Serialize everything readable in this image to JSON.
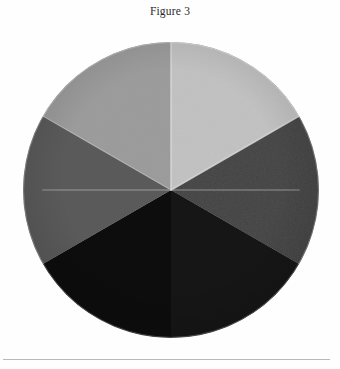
{
  "figure": {
    "caption": "Figure 3"
  },
  "chart_data": {
    "type": "pie",
    "title": "Figure 3",
    "subtitle": "",
    "xlabel": "",
    "ylabel": "",
    "legend": "none",
    "grid": false,
    "note": "Six-sector grayscale value wheel; each sector spans 60 degrees of the circle.",
    "center_x": 171,
    "center_y": 190,
    "radius": 148,
    "total_segments": 6,
    "categories": [
      "Light gray",
      "Medium-light gray",
      "Medium gray",
      "Dark gray (textured)",
      "Very dark gray",
      "Black"
    ],
    "values": [
      16.6667,
      16.6667,
      16.6667,
      16.6667,
      16.6667,
      16.6667
    ],
    "segments": [
      {
        "label": "Light gray",
        "color": "#c3c3c3",
        "start_angle": -90,
        "end_angle": -30,
        "sweep": 60,
        "share_percent": 16.7,
        "texture": "smooth",
        "position": "top"
      },
      {
        "label": "Dark gray (textured)",
        "color": "#4e4e4e",
        "start_angle": -30,
        "end_angle": 30,
        "sweep": 60,
        "share_percent": 16.7,
        "texture": "grainy",
        "position": "upper-right"
      },
      {
        "label": "Black",
        "color": "#161616",
        "start_angle": 30,
        "end_angle": 90,
        "sweep": 60,
        "share_percent": 16.7,
        "texture": "smooth",
        "position": "lower-right"
      },
      {
        "label": "Very dark gray",
        "color": "#0c0c0c",
        "start_angle": 90,
        "end_angle": 150,
        "sweep": 60,
        "share_percent": 16.7,
        "texture": "smooth",
        "position": "bottom"
      },
      {
        "label": "Medium gray",
        "color": "#5b5b5b",
        "start_angle": 150,
        "end_angle": 210,
        "sweep": 60,
        "share_percent": 16.7,
        "texture": "smooth",
        "position": "lower-left"
      },
      {
        "label": "Medium-light gray",
        "color": "#9d9d9d",
        "start_angle": 210,
        "end_angle": 270,
        "sweep": 60,
        "share_percent": 16.7,
        "texture": "smooth",
        "position": "upper-left"
      }
    ],
    "seam_color": "#d8d8d8",
    "background_color": "#fefefe"
  },
  "footer": {
    "rule_color": "#b9b9b9"
  }
}
